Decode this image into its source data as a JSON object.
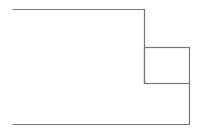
{
  "diagram": {
    "background": "#ffffff",
    "stroke_color": "#777777",
    "stroke_width": 1.2,
    "shapes": {
      "outline": {
        "description": "L-shaped outer outline",
        "points": "12.5,9.5 144.5,9.5 144.5,83.5 189.5,83.5 189.5,124.5 12.5,124.5"
      },
      "small_box": {
        "description": "small rectangle attached on right side",
        "x": 144.5,
        "y": 47.5,
        "width": 45,
        "height": 36
      }
    }
  }
}
